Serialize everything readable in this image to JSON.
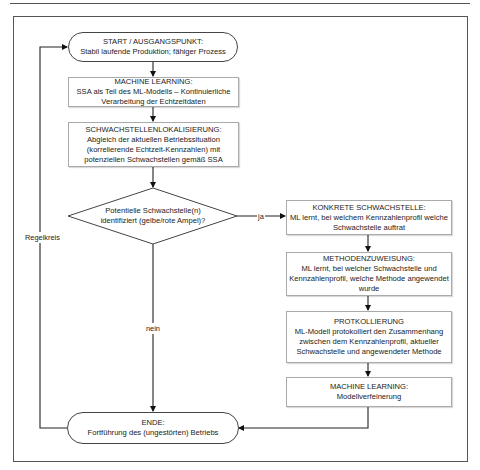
{
  "diagram": {
    "nodes": {
      "start": {
        "title": "START / AUSGANGSPUNKT:",
        "text": "Stabil laufende Produktion; fähiger Prozess"
      },
      "ml1": {
        "title": "MACHINE LEARNING:",
        "line1": "SSA als Teil des ML-Modells – Kontinuierliche",
        "line2": "Verarbeitung der Echtzeitdaten"
      },
      "lokalisierung": {
        "title": "SCHWACHSTELLENLOKALISIERUNG:",
        "line1": "Abgleich der aktuellen Betriebssituation",
        "line2": "(korrelierende Echtzeit-Kennzahlen) mit",
        "line3": "potenziellen Schwachstellen gemäß SSA"
      },
      "decision": {
        "line1": "Potentielle Schwachstelle(n)",
        "line2": "identifiziert (gelbe/rote Ampel)?"
      },
      "konkret": {
        "title": "KONKRETE SCHWACHSTELLE:",
        "line1": "ML lernt, bei welchem Kennzahlenprofil welche",
        "line2": "Schwachstelle auftrat"
      },
      "methoden": {
        "title": "METHODENZUWEISUNG:",
        "line1": "ML lernt, bei welcher Schwachstelle und",
        "line2": "Kennzahlenprofil, welche Methode angewendet",
        "line3": "wurde"
      },
      "protokoll": {
        "title": "PROTKOLLIERUNG",
        "line1": "ML-Modell protokolliert den Zusammenhang",
        "line2": "zwischen dem Kennzahlenprofil, aktueller",
        "line3": "Schwachstelle und angewendeter Methode"
      },
      "ml2": {
        "title": "MACHINE LEARNING:",
        "text": "Modellverfeinerung"
      },
      "ende": {
        "title": "ENDE:",
        "text": "Fortführung des (ungestörten) Betriebs"
      }
    },
    "edge_labels": {
      "yes": "ja",
      "no": "nein",
      "loop": "Regelkreis"
    }
  }
}
